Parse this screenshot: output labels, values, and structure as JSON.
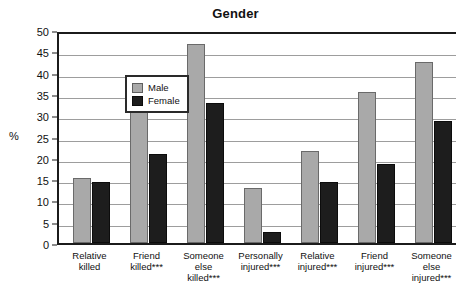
{
  "chart_data": {
    "type": "bar",
    "title": "Gender",
    "xlabel": "",
    "ylabel": "%",
    "ylim": [
      0,
      50
    ],
    "yticks": [
      0,
      5,
      10,
      15,
      20,
      25,
      30,
      35,
      40,
      45,
      50
    ],
    "grid": true,
    "legend_position": "top-left",
    "categories": [
      "Relative killed",
      "Friend killed***",
      "Someone else killed***",
      "Personally injured***",
      "Relative injured***",
      "Friend injured***",
      "Someone else injured***"
    ],
    "category_lines": [
      [
        "Relative",
        "killed"
      ],
      [
        "Friend",
        "killed***"
      ],
      [
        "Someone",
        "else",
        "killed***"
      ],
      [
        "Personally",
        "injured***"
      ],
      [
        "Relative",
        "injured***"
      ],
      [
        "Friend",
        "injured***"
      ],
      [
        "Someone",
        "else",
        "injured***"
      ]
    ],
    "series": [
      {
        "name": "Male",
        "color": "#a9a9a9",
        "values": [
          15.3,
          30.8,
          46.8,
          12.8,
          21.5,
          35.5,
          42.6
        ]
      },
      {
        "name": "Female",
        "color": "#1d1d1d",
        "values": [
          14.4,
          21.0,
          32.8,
          2.6,
          14.3,
          18.5,
          28.6
        ]
      }
    ]
  },
  "legend": {
    "items": [
      {
        "label": "Male"
      },
      {
        "label": "Female"
      }
    ]
  },
  "axis": {
    "y_label": "%",
    "tick_labels": [
      "50",
      "45",
      "40",
      "35",
      "30",
      "25",
      "20",
      "15",
      "10",
      "5",
      "0"
    ]
  },
  "colors": {
    "male_bar": "#a9a9a9",
    "female_bar": "#1d1d1d",
    "axis": "#1b1b1b",
    "gridline": "#9d9d9d",
    "background": "#ffffff"
  }
}
